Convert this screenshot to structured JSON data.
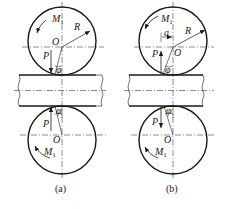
{
  "figure": {
    "panels": [
      {
        "caption": "(a)",
        "top_roll": {
          "moment": "M",
          "moment_sub": "1",
          "center": "O",
          "radius": "R",
          "force": "P",
          "angle": "φ"
        },
        "bottom_roll": {
          "moment": "M",
          "moment_sub": "1",
          "center": "O",
          "force": "P",
          "angle": "φ"
        }
      },
      {
        "caption": "(b)",
        "top_roll": {
          "moment": "M",
          "moment_sub": "1",
          "center": "O",
          "radius": "R",
          "force": "P",
          "angle": "φ",
          "arm": "a"
        },
        "bottom_roll": {
          "moment": "M",
          "moment_sub": "1",
          "center": "O",
          "force": "P",
          "angle": "φ"
        }
      }
    ]
  },
  "colors": {
    "stroke": "#1a1a1a",
    "background": "#ffffff"
  }
}
